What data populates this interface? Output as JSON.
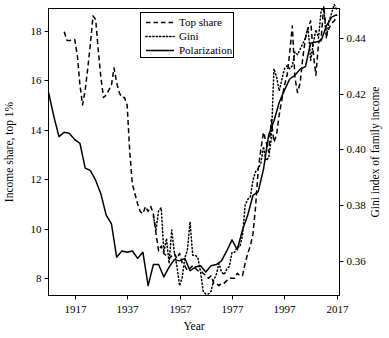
{
  "chart_data": {
    "type": "line",
    "title": "",
    "xlabel": "Year",
    "ylabel": "Income share, top 1%",
    "y2label": "Gini index of family income",
    "xlim": [
      1907,
      2018
    ],
    "ylim": [
      7.3,
      18.9
    ],
    "y2lim": [
      0.3475,
      0.4506
    ],
    "xticks": [
      1917,
      1937,
      1957,
      1977,
      1997,
      2017
    ],
    "xticklabels": [
      "1917",
      "1937",
      "1957",
      "1977",
      "1997",
      "2017"
    ],
    "yticks": [
      8,
      10,
      12,
      14,
      16,
      18
    ],
    "yticklabels": [
      "8",
      "10",
      "12",
      "14",
      "16",
      "18"
    ],
    "y2ticks": [
      0.36,
      0.38,
      0.4,
      0.42,
      0.44
    ],
    "y2ticklabels": [
      "0.36",
      "0.38",
      "0.40",
      "0.42",
      "0.44"
    ],
    "grid": false,
    "legend_position": "top-center",
    "legend": [
      {
        "name": "Top share",
        "style": "dashed",
        "axis": "left"
      },
      {
        "name": "Gini",
        "style": "dotted",
        "axis": "right"
      },
      {
        "name": "Polarization",
        "style": "solid",
        "axis": "left"
      }
    ],
    "series": [
      {
        "name": "Top share",
        "style": "dashed",
        "axis": "left",
        "x": [
          1913,
          1914,
          1915,
          1916,
          1917,
          1918,
          1919,
          1920,
          1921,
          1922,
          1923,
          1924,
          1925,
          1926,
          1927,
          1928,
          1929,
          1930,
          1931,
          1932,
          1933,
          1934,
          1935,
          1936,
          1937,
          1938,
          1939,
          1940,
          1941,
          1942,
          1943,
          1944,
          1945,
          1946,
          1947,
          1948,
          1949,
          1950,
          1951,
          1952,
          1953,
          1954,
          1955,
          1956,
          1957,
          1958,
          1959,
          1960,
          1961,
          1962,
          1963,
          1964,
          1965,
          1966,
          1967,
          1968,
          1969,
          1970,
          1971,
          1972,
          1973,
          1974,
          1975,
          1976,
          1977,
          1978,
          1979,
          1980,
          1981,
          1982,
          1983,
          1984,
          1985,
          1986,
          1987,
          1988,
          1989,
          1990,
          1991,
          1992,
          1993,
          1994,
          1995,
          1996,
          1997,
          1998,
          1999,
          2000,
          2001,
          2002,
          2003,
          2004,
          2005,
          2006,
          2007,
          2008,
          2009,
          2010,
          2011,
          2012,
          2013,
          2014,
          2015,
          2016,
          2017
        ],
        "y": [
          17.96,
          17.62,
          17.6,
          17.65,
          17.65,
          17.0,
          15.8,
          15.0,
          15.6,
          16.5,
          17.5,
          18.6,
          18.45,
          17.2,
          16.1,
          15.3,
          15.4,
          15.6,
          15.8,
          16.5,
          15.9,
          15.5,
          15.3,
          15.3,
          15.0,
          13.1,
          11.8,
          11.4,
          11.0,
          10.7,
          10.6,
          10.9,
          10.7,
          10.9,
          10.6,
          9.8,
          9.1,
          9.3,
          9.0,
          8.9,
          8.8,
          8.9,
          9.0,
          8.8,
          9.0,
          8.6,
          8.5,
          8.3,
          8.4,
          8.5,
          8.4,
          8.3,
          8.3,
          8.2,
          8.1,
          8.0,
          8.1,
          7.8,
          7.8,
          7.7,
          7.8,
          7.8,
          7.9,
          8.0,
          8.0,
          8.0,
          8.2,
          8.1,
          8.1,
          8.6,
          9.0,
          9.3,
          9.8,
          10.9,
          12.4,
          13.2,
          13.9,
          13.5,
          13.1,
          14.4,
          13.5,
          13.8,
          14.6,
          15.2,
          15.8,
          16.2,
          17.1,
          18.2,
          16.1,
          15.5,
          15.9,
          16.9,
          17.7,
          18.1,
          18.4,
          17.1,
          16.2,
          17.5,
          17.7,
          19.0,
          17.8,
          18.1,
          18.3,
          18.4,
          18.65
        ]
      },
      {
        "name": "Gini",
        "style": "dotted",
        "axis": "right",
        "x": [
          1947,
          1948,
          1949,
          1950,
          1951,
          1952,
          1953,
          1954,
          1955,
          1956,
          1957,
          1958,
          1959,
          1960,
          1961,
          1962,
          1963,
          1964,
          1965,
          1966,
          1967,
          1968,
          1969,
          1970,
          1971,
          1972,
          1973,
          1974,
          1975,
          1976,
          1977,
          1978,
          1979,
          1980,
          1981,
          1982,
          1983,
          1984,
          1985,
          1986,
          1987,
          1988,
          1989,
          1990,
          1991,
          1992,
          1993,
          1994,
          1995,
          1996,
          1997,
          1998,
          1999,
          2000,
          2001,
          2002,
          2003,
          2004,
          2005,
          2006,
          2007,
          2008,
          2009,
          2010,
          2011,
          2012,
          2013,
          2014,
          2015,
          2016,
          2017
        ],
        "y": [
          0.376,
          0.371,
          0.378,
          0.379,
          0.363,
          0.368,
          0.359,
          0.371,
          0.363,
          0.358,
          0.351,
          0.354,
          0.361,
          0.364,
          0.374,
          0.362,
          0.362,
          0.361,
          0.356,
          0.349,
          0.348,
          0.348,
          0.349,
          0.353,
          0.355,
          0.359,
          0.356,
          0.355,
          0.357,
          0.358,
          0.363,
          0.363,
          0.365,
          0.365,
          0.369,
          0.38,
          0.382,
          0.383,
          0.389,
          0.392,
          0.393,
          0.395,
          0.401,
          0.396,
          0.397,
          0.404,
          0.429,
          0.426,
          0.421,
          0.425,
          0.429,
          0.43,
          0.429,
          0.43,
          0.435,
          0.434,
          0.436,
          0.438,
          0.44,
          0.444,
          0.432,
          0.438,
          0.443,
          0.44,
          0.45,
          0.451,
          0.44,
          0.446,
          0.449,
          0.452,
          0.45
        ]
      },
      {
        "name": "Polarization",
        "style": "solid",
        "axis": "left",
        "x": [
          1907,
          1909,
          1911,
          1913,
          1915,
          1917,
          1919,
          1921,
          1923,
          1925,
          1927,
          1929,
          1931,
          1933,
          1935,
          1937,
          1939,
          1941,
          1943,
          1945,
          1947,
          1949,
          1951,
          1953,
          1955,
          1957,
          1959,
          1961,
          1963,
          1965,
          1967,
          1969,
          1971,
          1973,
          1975,
          1977,
          1979,
          1981,
          1983,
          1985,
          1987,
          1989,
          1991,
          1993,
          1995,
          1997,
          1999,
          2001,
          2003,
          2005,
          2007,
          2009,
          2011,
          2013,
          2015,
          2017
        ],
        "y": [
          15.52,
          14.55,
          13.72,
          13.9,
          13.85,
          13.6,
          13.45,
          12.45,
          12.35,
          11.95,
          11.4,
          10.55,
          10.2,
          8.85,
          9.1,
          9.05,
          9.1,
          8.8,
          9.05,
          7.7,
          8.55,
          8.55,
          8.05,
          8.45,
          8.75,
          8.7,
          8.8,
          8.3,
          8.45,
          8.5,
          8.25,
          8.5,
          8.55,
          8.7,
          9.1,
          9.55,
          9.15,
          9.95,
          10.55,
          11.35,
          11.5,
          12.4,
          13.8,
          14.35,
          15.1,
          15.6,
          16.05,
          16.2,
          16.45,
          16.55,
          17.5,
          17.55,
          17.6,
          18.2,
          18.55,
          18.65
        ]
      }
    ]
  },
  "axes": {
    "x_title": "Year",
    "y_left_title": "Income share, top 1%",
    "y_right_title": "Gini index of family income"
  }
}
